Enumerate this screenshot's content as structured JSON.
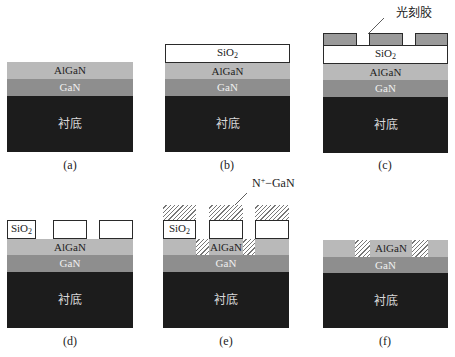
{
  "layers": {
    "algan": "AlGaN",
    "gan": "GaN",
    "substrate": "衬底",
    "sio2_main": "SiO",
    "sio2_sub": "2"
  },
  "annotations": {
    "photoresist": "光刻胶",
    "n_gan_prefix": "N",
    "n_gan_sup": "+",
    "n_gan_suffix": "−GaN"
  },
  "captions": {
    "a": "(a)",
    "b": "(b)",
    "c": "(c)",
    "d": "(d)",
    "e": "(e)",
    "f": "(f)"
  },
  "colors": {
    "algan": "#b9b9b9",
    "gan": "#8e8e8e",
    "substrate": "#1c1c1c",
    "photoresist": "#9a9a9a",
    "sio2": "#ffffff"
  }
}
